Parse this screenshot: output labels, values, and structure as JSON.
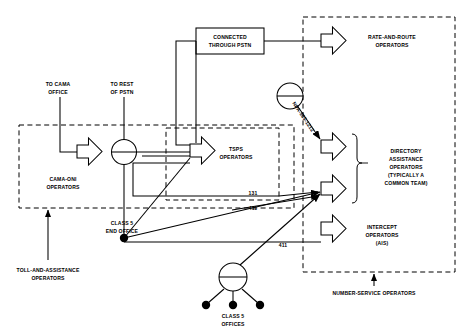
{
  "diagram": {
    "colors": {
      "line": "#000000",
      "background": "#ffffff",
      "text": "#000000"
    },
    "external_labels": [
      {
        "id": "to-cama-office",
        "line1": "TO CAMA",
        "line2": "OFFICE",
        "x": 58,
        "y": 88
      },
      {
        "id": "to-rest-of-pstn",
        "line1": "TO REST",
        "line2": "OF PSTN",
        "x": 120,
        "y": 88
      }
    ],
    "boxes": [
      {
        "id": "connected-through-pstn",
        "line1": "CONNECTED",
        "line2": "THROUGH PSTN",
        "x": 196,
        "y": 28,
        "w": 68,
        "h": 26
      }
    ],
    "groups": [
      {
        "id": "toll-and-assistance-operators",
        "line1": "TOLL-AND-ASSISTANCE",
        "line2": "OPERATORS",
        "x": 48,
        "y": 268
      },
      {
        "id": "number-service-operators",
        "line1": "NUMBER-SERVICE OPERATORS",
        "line2": "",
        "x": 374,
        "y": 290
      }
    ],
    "operators": [
      {
        "id": "cama-oni-operators",
        "line1": "CAMA-ONI",
        "line2": "OPERATORS",
        "line3": "",
        "line4": ""
      },
      {
        "id": "tsps-operators",
        "line1": "TSPS",
        "line2": "OPERATORS",
        "line3": "",
        "line4": ""
      },
      {
        "id": "rate-and-route-operators",
        "line1": "RATE-AND-ROUTE",
        "line2": "OPERATORS",
        "line3": "",
        "line4": ""
      },
      {
        "id": "directory-assistance-operators",
        "line1": "DIRECTORY",
        "line2": "ASSISTANCE",
        "line3": "OPERATORS",
        "line4": "(TYPICALLY A",
        "line5": "COMMON TEAM)"
      },
      {
        "id": "intercept-operators",
        "line1": "INTERCEPT",
        "line2": "OPERATORS",
        "line3": "(AIS)",
        "line4": ""
      }
    ],
    "switches": [
      {
        "id": "tandem-switch-upper",
        "label": "",
        "x": 124,
        "y": 152
      },
      {
        "id": "switch-npa-555-1212",
        "label": "",
        "x": 290,
        "y": 96
      },
      {
        "id": "class-5-offices-switch",
        "line1": "CLASS 5",
        "line2": "OFFICES",
        "x": 233,
        "y": 277
      }
    ],
    "nodes": [
      {
        "id": "class-5-end-office",
        "line1": "CLASS 5",
        "line2": "END OFFICE",
        "x": 122,
        "y": 228
      }
    ],
    "call_labels": [
      {
        "id": "npa-555-1212-label",
        "text": "NPA-555-1212",
        "angle": 46
      },
      {
        "id": "code-131",
        "text": "131"
      },
      {
        "id": "code-411-upper",
        "text": "411"
      },
      {
        "id": "code-411-lower",
        "text": "411"
      }
    ]
  }
}
